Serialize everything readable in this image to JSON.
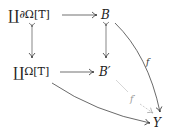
{
  "diagram": {
    "type": "commutative-diagram",
    "nodes": {
      "top_left": {
        "coprod": "∐",
        "text": "∂Ω[T]"
      },
      "top_right": {
        "text": "B"
      },
      "mid_left": {
        "coprod": "∐",
        "text": "Ω[T]"
      },
      "mid_right": {
        "text": "B′"
      },
      "bottom_right": {
        "text": "Y"
      }
    },
    "edges": [
      {
        "from": "top_left",
        "to": "top_right",
        "style": "solid"
      },
      {
        "from": "top_left",
        "to": "mid_left",
        "style": "monomorphism"
      },
      {
        "from": "top_right",
        "to": "mid_right",
        "style": "monomorphism"
      },
      {
        "from": "mid_left",
        "to": "mid_right",
        "style": "solid"
      },
      {
        "from": "top_right",
        "to": "bottom_right",
        "style": "curved",
        "label": "f"
      },
      {
        "from": "mid_left",
        "to": "bottom_right",
        "style": "curved"
      },
      {
        "from": "mid_right",
        "to": "bottom_right",
        "style": "dashed-faint",
        "label": "f′"
      }
    ],
    "labels": {
      "f": "f",
      "f_prime": "f′"
    },
    "colors": {
      "arrow": "#333333",
      "faint_arrow": "#aaaaaa"
    }
  }
}
